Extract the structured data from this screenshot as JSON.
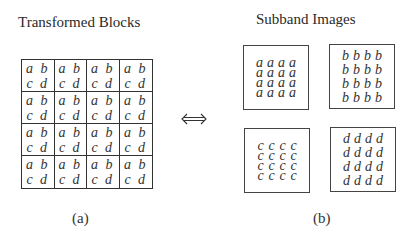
{
  "panel_a": {
    "title": "Transformed Blocks",
    "caption": "(a)",
    "grid": {
      "rows": 4,
      "cols": 4,
      "cell_top": "a b",
      "cell_bottom": "c d"
    }
  },
  "arrow": {
    "symbol": "⟺",
    "meaning": "equivalence"
  },
  "panel_b": {
    "title": "Subband Images",
    "caption": "(b)",
    "subbands": [
      {
        "letter": "a",
        "rows": 4,
        "cols": 4
      },
      {
        "letter": "b",
        "rows": 4,
        "cols": 4
      },
      {
        "letter": "c",
        "rows": 4,
        "cols": 4
      },
      {
        "letter": "d",
        "rows": 4,
        "cols": 4
      }
    ]
  }
}
